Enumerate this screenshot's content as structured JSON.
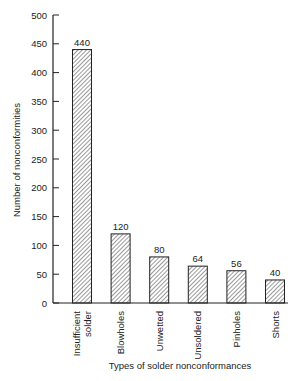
{
  "chart_data": {
    "type": "bar",
    "title": "",
    "xlabel": "Types of solder nonconformances",
    "ylabel": "Number of nonconformities",
    "categories": [
      "Insufficient solder",
      "Blowholes",
      "Unwetted",
      "Unsoldered",
      "Pinholes",
      "Shorts"
    ],
    "category_lines": [
      [
        "Insufficient",
        "solder"
      ],
      [
        "Blowholes"
      ],
      [
        "Unwetted"
      ],
      [
        "Unsoldered"
      ],
      [
        "Pinholes"
      ],
      [
        "Shorts"
      ]
    ],
    "values": [
      440,
      120,
      80,
      64,
      56,
      40
    ],
    "ylim": [
      0,
      500
    ],
    "yticks": [
      0,
      50,
      100,
      150,
      200,
      250,
      300,
      350,
      400,
      450,
      500
    ],
    "grid": false,
    "legend": null,
    "bar_fill": "hatched",
    "bar_color": "#333333"
  }
}
